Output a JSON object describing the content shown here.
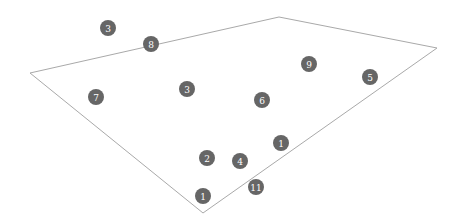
{
  "diagram": {
    "outline_color": "#a9a9a9",
    "marker_color": "#666666",
    "marker_text_color": "#ffffff",
    "marker_radius": 8,
    "polygon": [
      [
        30,
        73
      ],
      [
        279,
        17
      ],
      [
        437,
        48
      ],
      [
        203,
        213
      ]
    ],
    "markers": [
      {
        "label": "3",
        "x": 108,
        "y": 28
      },
      {
        "label": "8",
        "x": 151,
        "y": 44
      },
      {
        "label": "7",
        "x": 96,
        "y": 97
      },
      {
        "label": "3",
        "x": 187,
        "y": 89
      },
      {
        "label": "6",
        "x": 262,
        "y": 100
      },
      {
        "label": "9",
        "x": 309,
        "y": 64
      },
      {
        "label": "5",
        "x": 370,
        "y": 77
      },
      {
        "label": "1",
        "x": 281,
        "y": 143
      },
      {
        "label": "2",
        "x": 207,
        "y": 158
      },
      {
        "label": "4",
        "x": 240,
        "y": 161
      },
      {
        "label": "11",
        "x": 256,
        "y": 187
      },
      {
        "label": "1",
        "x": 203,
        "y": 196
      }
    ]
  }
}
